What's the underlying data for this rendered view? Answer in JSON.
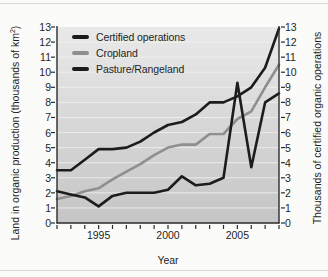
{
  "figure": {
    "xaxis_title": "Year",
    "yaxis_left_title_pre": "Land in organic production (thousands of km",
    "yaxis_left_title_sup": "2",
    "yaxis_left_title_post": ")",
    "yaxis_right_title": "Thousands of certified organic operations"
  },
  "colors": {
    "black_line": "#1c1c1c",
    "gray_line": "#8f8f8f",
    "plot_bg_top": "#e9e9e9",
    "plot_bg_bottom": "#c5c5c5",
    "gridline": "#f2f2ef",
    "axis": "#2b2b2b",
    "text": "#1f1f1f"
  },
  "chart_data": {
    "type": "line",
    "title": "",
    "xlabel": "Year",
    "ylabel_left": "Land in organic production (thousands of km2)",
    "ylabel_right": "Thousands of certified organic operations",
    "xlim": [
      1992,
      2008
    ],
    "ylim": [
      0,
      13
    ],
    "grid": true,
    "legend_position": "top-left",
    "x": [
      1992,
      1993,
      1994,
      1995,
      1996,
      1997,
      1998,
      1999,
      2000,
      2001,
      2002,
      2003,
      2004,
      2005,
      2006,
      2007,
      2008
    ],
    "y_ticks": [
      0,
      1,
      2,
      3,
      4,
      5,
      6,
      7,
      8,
      9,
      10,
      11,
      12,
      13
    ],
    "x_tick_labels": [
      1995,
      2000,
      2005
    ],
    "series": [
      {
        "name": "Certified operations",
        "axis": "right",
        "color": "#1c1c1c",
        "values": [
          3.5,
          3.5,
          4.2,
          4.9,
          4.9,
          5.0,
          5.4,
          6.0,
          6.5,
          6.7,
          7.2,
          8.0,
          8.0,
          8.4,
          9.0,
          10.3,
          12.9
        ]
      },
      {
        "name": "Cropland",
        "axis": "left",
        "color": "#8f8f8f",
        "values": [
          1.6,
          1.8,
          2.1,
          2.3,
          2.9,
          3.4,
          3.9,
          4.5,
          5.0,
          5.2,
          5.2,
          5.9,
          5.9,
          6.9,
          7.4,
          9.0,
          10.5
        ]
      },
      {
        "name": "Pasture/Rangeland",
        "axis": "left",
        "color": "#1c1c1c",
        "values": [
          2.1,
          1.9,
          1.7,
          1.1,
          1.8,
          2.0,
          2.0,
          2.0,
          2.2,
          3.1,
          2.5,
          2.6,
          3.0,
          9.3,
          3.7,
          8.0,
          8.6
        ]
      }
    ]
  }
}
